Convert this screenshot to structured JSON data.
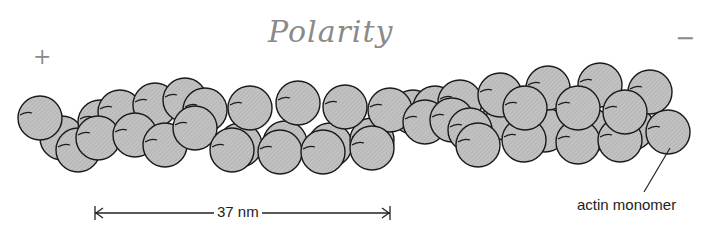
{
  "annotations": {
    "polarity": "Polarity",
    "plus_end": "+",
    "minus_end": "−"
  },
  "scale_bar": {
    "label": "37 nm",
    "x_start": 95,
    "x_end": 390,
    "y": 213
  },
  "callout": {
    "label": "actin monomer",
    "line": {
      "x1": 670,
      "y1": 148,
      "x2": 644,
      "y2": 192
    }
  },
  "colors": {
    "monomer_fill": "#bdbdbd",
    "monomer_stroke": "#1a1a1a",
    "text": "#222222",
    "handwriting": "#8a8a8a"
  },
  "filament": {
    "monomer_radius": 22,
    "back_strand": [
      {
        "x": 62,
        "y": 138
      },
      {
        "x": 100,
        "y": 122
      },
      {
        "x": 120,
        "y": 112
      },
      {
        "x": 155,
        "y": 105
      },
      {
        "x": 185,
        "y": 100
      },
      {
        "x": 240,
        "y": 145
      },
      {
        "x": 285,
        "y": 143
      },
      {
        "x": 330,
        "y": 145
      },
      {
        "x": 372,
        "y": 140
      },
      {
        "x": 413,
        "y": 112
      },
      {
        "x": 435,
        "y": 108
      },
      {
        "x": 460,
        "y": 102
      },
      {
        "x": 505,
        "y": 118
      },
      {
        "x": 545,
        "y": 130
      },
      {
        "x": 590,
        "y": 130
      },
      {
        "x": 632,
        "y": 128
      }
    ],
    "front_strand": [
      {
        "x": 40,
        "y": 118
      },
      {
        "x": 78,
        "y": 150
      },
      {
        "x": 98,
        "y": 138
      },
      {
        "x": 135,
        "y": 135
      },
      {
        "x": 165,
        "y": 145
      },
      {
        "x": 205,
        "y": 110
      },
      {
        "x": 195,
        "y": 128
      },
      {
        "x": 250,
        "y": 108
      },
      {
        "x": 232,
        "y": 150
      },
      {
        "x": 298,
        "y": 103
      },
      {
        "x": 280,
        "y": 152
      },
      {
        "x": 345,
        "y": 107
      },
      {
        "x": 323,
        "y": 152
      },
      {
        "x": 390,
        "y": 110
      },
      {
        "x": 372,
        "y": 148
      },
      {
        "x": 425,
        "y": 122
      },
      {
        "x": 452,
        "y": 120
      },
      {
        "x": 470,
        "y": 130
      },
      {
        "x": 500,
        "y": 95
      },
      {
        "x": 478,
        "y": 145
      },
      {
        "x": 548,
        "y": 88
      },
      {
        "x": 524,
        "y": 140
      },
      {
        "x": 525,
        "y": 108
      },
      {
        "x": 600,
        "y": 85
      },
      {
        "x": 578,
        "y": 142
      },
      {
        "x": 578,
        "y": 108
      },
      {
        "x": 650,
        "y": 92
      },
      {
        "x": 620,
        "y": 140
      },
      {
        "x": 625,
        "y": 112
      },
      {
        "x": 668,
        "y": 132
      }
    ]
  }
}
